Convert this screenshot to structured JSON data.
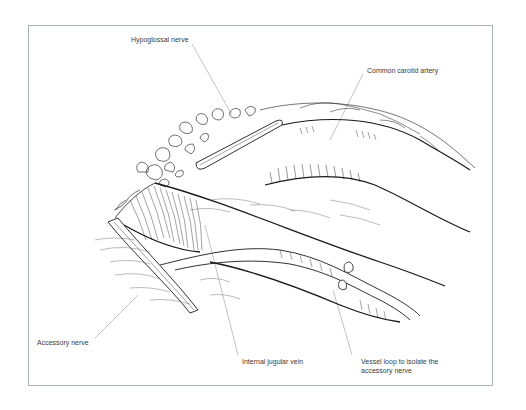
{
  "figure": {
    "type": "surgical line illustration",
    "frame_color": "#a9b5b2",
    "line_color": "#1a1a1a",
    "leader_color": "#9a9a9a"
  },
  "labels": [
    {
      "id": "hypoglossal",
      "text": "Hypoglossal nerve"
    },
    {
      "id": "carotid",
      "text": "Common carotid artery"
    },
    {
      "id": "accessory",
      "text": "Accessory nerve"
    },
    {
      "id": "jugular",
      "text": "Internal jugular vein"
    },
    {
      "id": "vessel_loop",
      "text": "Vessel loop to isolate the accessory nerve"
    }
  ]
}
